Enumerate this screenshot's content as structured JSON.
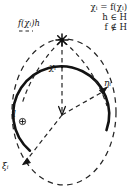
{
  "figure": {
    "colors": {
      "stroke": "#141414",
      "dash": "#2a2a2a",
      "background": "#ffffff"
    },
    "formula": {
      "line1": "χᵢ = f(χᵢ)",
      "line2": "h ∈ H",
      "line3": "f ∉ H"
    },
    "labels": {
      "apex": "f(χᵢ)h",
      "top": "χᵢ",
      "right": "ηᵢ",
      "left": "l⊕",
      "bottom_left": "ξᵢ"
    },
    "geometry": {
      "circle_center_x": 62,
      "circle_center_y": 115,
      "circle_radius": 48,
      "apex_x": 62,
      "apex_y": 40,
      "ellipse_center_x": 64,
      "ellipse_center_y": 112,
      "ellipse_rx": 52,
      "ellipse_ry": 73,
      "solid_arc_start_deg": 228,
      "solid_arc_end_deg": 338
    }
  }
}
